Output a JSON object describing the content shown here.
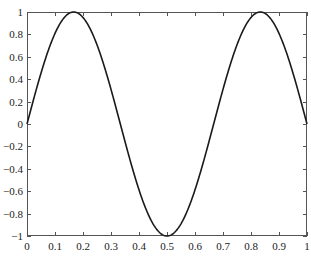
{
  "chart_data": {
    "type": "line",
    "title": "",
    "xlabel": "",
    "ylabel": "",
    "xlim": [
      0,
      1
    ],
    "ylim": [
      -1,
      1
    ],
    "grid": false,
    "legend": null,
    "x_ticks": [
      0,
      0.1,
      0.2,
      0.3,
      0.4,
      0.5,
      0.6,
      0.7,
      0.8,
      0.9,
      1
    ],
    "x_tick_labels": [
      "0",
      "0.1",
      "0.2",
      "0.3",
      "0.4",
      "0.5",
      "0.6",
      "0.7",
      "0.8",
      "0.9",
      "1"
    ],
    "y_ticks": [
      -1,
      -0.8,
      -0.6,
      -0.4,
      -0.2,
      0,
      0.2,
      0.4,
      0.6,
      0.8,
      1
    ],
    "y_tick_labels": [
      "-1",
      "-0.8",
      "-0.6",
      "-0.4",
      "-0.2",
      "0",
      "0.2",
      "0.4",
      "0.6",
      "0.8",
      "1"
    ],
    "series": [
      {
        "name": "y = sin(3πx)",
        "color": "#1a1a1a",
        "x": [
          0,
          0.05,
          0.1,
          0.1667,
          0.25,
          0.3333,
          0.4,
          0.45,
          0.5,
          0.55,
          0.6,
          0.6667,
          0.75,
          0.8333,
          0.9,
          0.95,
          1
        ],
        "y": [
          0,
          0.454,
          0.809,
          1.0,
          0.707,
          0,
          -0.588,
          -0.891,
          -1.0,
          -0.891,
          -0.588,
          0,
          0.707,
          1.0,
          0.809,
          0.454,
          0
        ]
      }
    ]
  },
  "style": {
    "axis_color": "#555555",
    "line_color": "#1a1a1a",
    "background": "#ffffff"
  }
}
